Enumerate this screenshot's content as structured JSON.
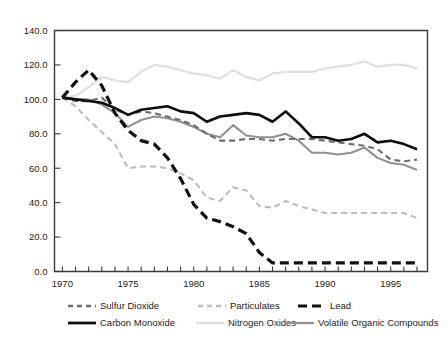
{
  "chart_data": {
    "type": "line",
    "title": "",
    "subtitle": "",
    "xlabel": "",
    "ylabel": "",
    "xlim": [
      1969.4,
      1997.8
    ],
    "ylim": [
      0.0,
      140.0
    ],
    "grid": false,
    "legend_position": "bottom",
    "y_ticks": [
      "0.0",
      "20.0",
      "40.0",
      "60.0",
      "80.0",
      "100.0",
      "120.0",
      "140.0"
    ],
    "y_tick_values": [
      0,
      20,
      40,
      60,
      80,
      100,
      120,
      140
    ],
    "x_ticks": [
      "1970",
      "1975",
      "1980",
      "1985",
      "1990",
      "1995"
    ],
    "x_tick_values": [
      1970,
      1975,
      1980,
      1985,
      1990,
      1995
    ],
    "x_minor_step": 1,
    "x": [
      1970,
      1971,
      1972,
      1973,
      1974,
      1975,
      1976,
      1977,
      1978,
      1979,
      1980,
      1981,
      1982,
      1983,
      1984,
      1985,
      1986,
      1987,
      1988,
      1989,
      1990,
      1991,
      1992,
      1993,
      1994,
      1995,
      1996,
      1997
    ],
    "series": [
      {
        "name": "Sulfur Dioxide",
        "color": "#6e6e6e",
        "style": "dashed",
        "width": 2.1,
        "values": [
          101,
          99,
          99,
          101,
          94,
          91,
          93,
          92,
          90,
          88,
          85,
          80,
          76,
          76,
          77,
          77,
          76,
          77,
          77,
          77,
          76,
          75,
          74,
          73,
          71,
          65,
          64,
          65
        ]
      },
      {
        "name": "Particulates",
        "color": "#bcbcbc",
        "style": "dashed",
        "width": 2.1,
        "values": [
          101,
          96,
          88,
          81,
          74,
          60,
          61,
          61,
          60,
          57,
          53,
          43,
          41,
          49,
          47,
          38,
          37,
          41,
          38,
          36,
          34,
          34,
          34,
          34,
          34,
          34,
          34,
          31
        ]
      },
      {
        "name": "Lead",
        "color": "#111111",
        "style": "dashed",
        "width": 3.2,
        "values": [
          101,
          110,
          117,
          108,
          92,
          82,
          76,
          74,
          66,
          54,
          39,
          31,
          29,
          26,
          22,
          11,
          5,
          5,
          5,
          5,
          5,
          5,
          5,
          5,
          5,
          5,
          5,
          5
        ]
      },
      {
        "name": "Carbon Monoxide",
        "color": "#0d0d0d",
        "style": "solid",
        "width": 2.6,
        "values": [
          101,
          100,
          99,
          98,
          95,
          91,
          94,
          95,
          96,
          93,
          92,
          87,
          90,
          91,
          92,
          91,
          87,
          93,
          86,
          78,
          78,
          76,
          77,
          80,
          75,
          76,
          74,
          71
        ]
      },
      {
        "name": "Nitrogen Oxides",
        "color": "#e0e0e0",
        "style": "solid",
        "width": 2.3,
        "values": [
          101,
          102,
          107,
          113,
          111,
          110,
          116,
          120,
          119,
          117,
          115,
          114,
          112,
          117,
          113,
          111,
          115,
          116,
          116,
          116,
          118,
          119,
          120,
          122,
          119,
          120,
          120,
          118
        ]
      },
      {
        "name": "Volatile Organic Compounds",
        "color": "#919191",
        "style": "solid",
        "width": 2.1,
        "values": [
          101,
          100,
          100,
          97,
          92,
          84,
          88,
          90,
          89,
          87,
          84,
          80,
          78,
          85,
          79,
          78,
          78,
          80,
          76,
          69,
          69,
          68,
          69,
          72,
          66,
          63,
          62,
          59
        ]
      }
    ]
  },
  "legend": {
    "rows": [
      [
        {
          "label": "Sulfur Dioxide",
          "marker": "dashed-line-swatch",
          "color": "#6e6e6e"
        },
        {
          "label": "Particulates",
          "marker": "dashed-line-swatch",
          "color": "#bcbcbc"
        },
        {
          "label": "Lead",
          "marker": "dashed-line-swatch",
          "color": "#111111"
        }
      ],
      [
        {
          "label": "Carbon Monoxide",
          "marker": "solid-line-swatch",
          "color": "#0d0d0d"
        },
        {
          "label": "Nitrogen Oxides",
          "marker": "solid-line-swatch",
          "color": "#e0e0e0"
        },
        {
          "label": "Volatile Organic Compounds",
          "marker": "solid-line-swatch",
          "color": "#919191"
        }
      ]
    ]
  }
}
